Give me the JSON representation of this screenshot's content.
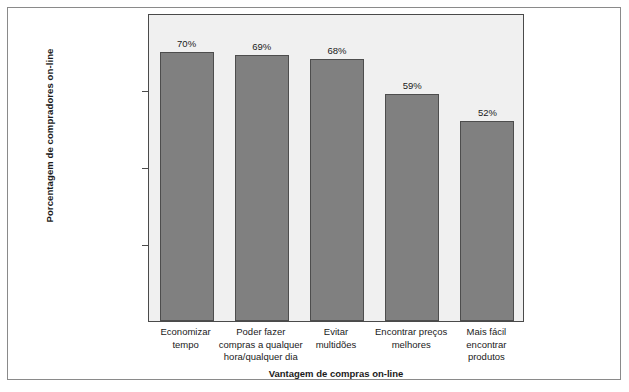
{
  "chart_data": {
    "type": "bar",
    "title": "",
    "xlabel": "Vantagem de compras on-line",
    "ylabel": "Porcentagem de compradores on-line",
    "categories": [
      "Economizar tempo",
      "Poder fazer compras a qualquer hora/qualquer dia",
      "Evitar multidões",
      "Encontrar preços melhores",
      "Mais fácil encontrar produtos"
    ],
    "category_lines": [
      [
        "Economizar",
        "tempo"
      ],
      [
        "Poder fazer",
        "compras a qualquer",
        "hora/qualquer dia"
      ],
      [
        "Evitar",
        "multidões"
      ],
      [
        "Encontrar preços",
        "melhores"
      ],
      [
        "Mais fácil",
        "encontrar",
        "produtos"
      ]
    ],
    "values": [
      70,
      69,
      68,
      59,
      52
    ],
    "data_labels": [
      "70%",
      "69%",
      "68%",
      "59%",
      "52%"
    ],
    "ylim": [
      0,
      80
    ],
    "yticks": [
      0,
      20,
      40,
      60,
      80
    ],
    "ytick_labels": [
      "0%",
      "20%",
      "40%",
      "60%",
      "80%"
    ],
    "grid": false,
    "legend": "none",
    "colors": {
      "bar_fill": "#808080",
      "bar_edge": "#4d4d4d",
      "plot_background": "#f0f0f0",
      "plot_border": "#4a4a4a",
      "figure_border": "#8a8a8a",
      "text": "#1a1a1a"
    }
  }
}
